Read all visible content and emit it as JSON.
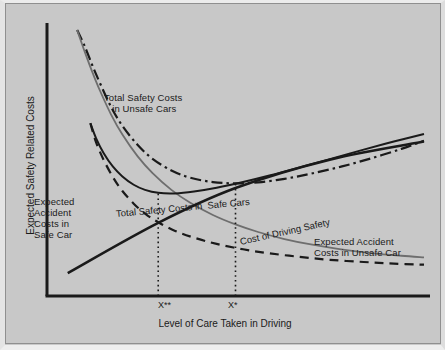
{
  "figure": {
    "background_color": "#c8c8c8",
    "ink_color": "#1a1a1a",
    "gray_curve_color": "#6e6e6e"
  },
  "axes": {
    "y_axis_label": "Expected Safety Related Costs",
    "x_axis_label": "Level of Care Taken in Driving",
    "x_ticks": [
      {
        "label": "X**",
        "x_frac": 0.295
      },
      {
        "label": "X*",
        "x_frac": 0.5
      }
    ]
  },
  "annotations": {
    "total_unsafe": "Total Safety Costs\n   in Unsafe Cars",
    "accident_safe": "Expected\nAccident\nCosts in\nSafe Car",
    "total_safe": "Total Safety Costs in  Safe Cars",
    "cost_of_care": "Cost of Driving Safety",
    "accident_unsafe": "Expected Accident\nCosts in Unsafe Car"
  },
  "chart_data": {
    "type": "line",
    "title": "",
    "xlabel": "Level of Care Taken in Driving",
    "ylabel": "Expected Safety Related Costs",
    "xlim": [
      0,
      1
    ],
    "ylim": [
      0,
      1
    ],
    "grid": false,
    "legend": "inline-annotations",
    "x_tick_labels": [
      "X**",
      "X*"
    ],
    "x_tick_values": [
      0.295,
      0.5
    ],
    "series": [
      {
        "name": "Total Safety Costs in Unsafe Cars",
        "style": "dash-dot",
        "color": "#1a1a1a",
        "width": 2.2,
        "points": [
          [
            0.08,
            0.985
          ],
          [
            0.1,
            0.925
          ],
          [
            0.12,
            0.855
          ],
          [
            0.14,
            0.79
          ],
          [
            0.17,
            0.7
          ],
          [
            0.2,
            0.63
          ],
          [
            0.24,
            0.56
          ],
          [
            0.28,
            0.508
          ],
          [
            0.33,
            0.465
          ],
          [
            0.38,
            0.438
          ],
          [
            0.44,
            0.422
          ],
          [
            0.5,
            0.417
          ],
          [
            0.56,
            0.421
          ],
          [
            0.63,
            0.434
          ],
          [
            0.7,
            0.453
          ],
          [
            0.78,
            0.479
          ],
          [
            0.86,
            0.51
          ],
          [
            0.94,
            0.545
          ],
          [
            1.0,
            0.575
          ]
        ]
      },
      {
        "name": "Expected Accident Costs in Unsafe Car",
        "style": "solid",
        "color": "#6e6e6e",
        "width": 1.8,
        "points": [
          [
            0.08,
            0.985
          ],
          [
            0.1,
            0.905
          ],
          [
            0.12,
            0.83
          ],
          [
            0.14,
            0.762
          ],
          [
            0.17,
            0.672
          ],
          [
            0.2,
            0.598
          ],
          [
            0.24,
            0.518
          ],
          [
            0.28,
            0.455
          ],
          [
            0.33,
            0.393
          ],
          [
            0.38,
            0.345
          ],
          [
            0.44,
            0.3
          ],
          [
            0.5,
            0.265
          ],
          [
            0.56,
            0.237
          ],
          [
            0.63,
            0.211
          ],
          [
            0.7,
            0.191
          ],
          [
            0.78,
            0.173
          ],
          [
            0.86,
            0.159
          ],
          [
            0.94,
            0.149
          ],
          [
            1.0,
            0.143
          ]
        ]
      },
      {
        "name": "Total Safety Costs in Safe Cars",
        "style": "solid",
        "color": "#1a1a1a",
        "width": 2.0,
        "points": [
          [
            0.115,
            0.64
          ],
          [
            0.13,
            0.585
          ],
          [
            0.15,
            0.53
          ],
          [
            0.175,
            0.479
          ],
          [
            0.2,
            0.443
          ],
          [
            0.23,
            0.412
          ],
          [
            0.26,
            0.393
          ],
          [
            0.295,
            0.382
          ],
          [
            0.34,
            0.38
          ],
          [
            0.39,
            0.387
          ],
          [
            0.45,
            0.401
          ],
          [
            0.52,
            0.422
          ],
          [
            0.59,
            0.446
          ],
          [
            0.67,
            0.476
          ],
          [
            0.75,
            0.507
          ],
          [
            0.84,
            0.542
          ],
          [
            0.92,
            0.572
          ],
          [
            1.0,
            0.6
          ]
        ]
      },
      {
        "name": "Expected Accident Costs in Safe Car",
        "style": "dashed",
        "color": "#1a1a1a",
        "width": 2.2,
        "points": [
          [
            0.115,
            0.64
          ],
          [
            0.13,
            0.57
          ],
          [
            0.15,
            0.505
          ],
          [
            0.175,
            0.44
          ],
          [
            0.2,
            0.389
          ],
          [
            0.23,
            0.342
          ],
          [
            0.26,
            0.305
          ],
          [
            0.295,
            0.273
          ],
          [
            0.34,
            0.241
          ],
          [
            0.39,
            0.216
          ],
          [
            0.45,
            0.193
          ],
          [
            0.52,
            0.173
          ],
          [
            0.59,
            0.158
          ],
          [
            0.67,
            0.145
          ],
          [
            0.75,
            0.134
          ],
          [
            0.84,
            0.126
          ],
          [
            0.92,
            0.12
          ],
          [
            1.0,
            0.116
          ]
        ]
      },
      {
        "name": "Cost of Driving Safety",
        "style": "solid",
        "color": "#1a1a1a",
        "width": 2.6,
        "points": [
          [
            0.055,
            0.085
          ],
          [
            0.295,
            0.271
          ],
          [
            0.5,
            0.4
          ],
          [
            0.75,
            0.505
          ],
          [
            1.0,
            0.572
          ]
        ]
      }
    ],
    "drop_lines": [
      {
        "at": "X**",
        "x_frac": 0.295,
        "y_top_frac": 0.382,
        "style": "dotted"
      },
      {
        "at": "X*",
        "x_frac": 0.5,
        "y_top_frac": 0.417,
        "style": "dotted"
      }
    ],
    "marked_intersections": [
      {
        "x_frac": 0.295,
        "y_frac": 0.382,
        "note": "minimum of Total Safety Costs in Safe Cars"
      },
      {
        "x_frac": 0.295,
        "y_frac": 0.273,
        "note": "Expected Accident Costs in Safe Car meets Cost of Driving Safety"
      },
      {
        "x_frac": 0.5,
        "y_frac": 0.417,
        "note": "minimum of Total Safety Costs in Unsafe Cars"
      },
      {
        "x_frac": 0.5,
        "y_frac": 0.4,
        "note": "Cost of Driving Safety crosses Expected Accident Costs in Unsafe Car"
      }
    ]
  }
}
